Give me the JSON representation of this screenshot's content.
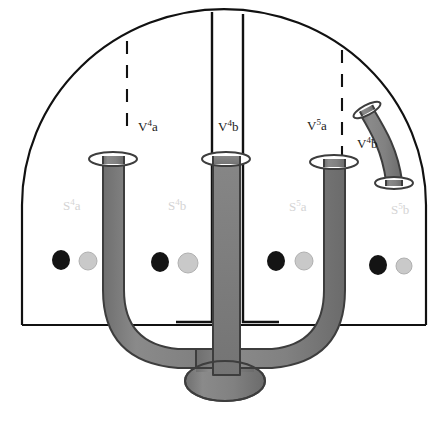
{
  "figure": {
    "background": "#ffffff",
    "outline_color": "#111111",
    "tube_fill": "#808080",
    "tube_stroke": "#3d3d3d",
    "dot_dark_color": "#141414",
    "dot_light_color": "#c9c9c9",
    "faint_label_color": "#d4d4d4"
  },
  "vessel_labels": [
    {
      "id": "v4a",
      "base": "V",
      "sup": "4",
      "tail": "a",
      "x": 138,
      "y": 131
    },
    {
      "id": "v4b",
      "base": "V",
      "sup": "4",
      "tail": "b",
      "x": 218,
      "y": 131
    },
    {
      "id": "v5a",
      "base": "V",
      "sup": "5",
      "tail": "a",
      "x": 307,
      "y": 130
    },
    {
      "id": "v4b_right",
      "base": "V",
      "sup": "4",
      "tail": "b",
      "x": 357,
      "y": 148
    }
  ],
  "chamber_labels": [
    {
      "id": "s4a",
      "base": "S",
      "sup": "4",
      "tail": "a",
      "x": 63,
      "y": 210
    },
    {
      "id": "s4b",
      "base": "S",
      "sup": "4",
      "tail": "b",
      "x": 168,
      "y": 210
    },
    {
      "id": "s5a",
      "base": "S",
      "sup": "5",
      "tail": "a",
      "x": 289,
      "y": 211
    },
    {
      "id": "s5b",
      "base": "S",
      "sup": "5",
      "tail": "b",
      "x": 391,
      "y": 214
    }
  ],
  "dots": [
    {
      "id": "dot-dark-1",
      "cx": 61,
      "cy": 260,
      "rx": 9,
      "ry": 10,
      "tone": "dark"
    },
    {
      "id": "dot-light-1",
      "cx": 88,
      "cy": 261,
      "rx": 9,
      "ry": 9,
      "tone": "light"
    },
    {
      "id": "dot-dark-2",
      "cx": 160,
      "cy": 262,
      "rx": 9,
      "ry": 10,
      "tone": "dark"
    },
    {
      "id": "dot-light-2",
      "cx": 188,
      "cy": 263,
      "rx": 10,
      "ry": 10,
      "tone": "light"
    },
    {
      "id": "dot-dark-3",
      "cx": 276,
      "cy": 261,
      "rx": 9,
      "ry": 10,
      "tone": "dark"
    },
    {
      "id": "dot-light-3",
      "cx": 304,
      "cy": 261,
      "rx": 9,
      "ry": 9,
      "tone": "light"
    },
    {
      "id": "dot-dark-4",
      "cx": 378,
      "cy": 265,
      "rx": 9,
      "ry": 10,
      "tone": "dark"
    },
    {
      "id": "dot-light-4",
      "cx": 404,
      "cy": 266,
      "rx": 8,
      "ry": 8,
      "tone": "light"
    }
  ],
  "tubes": {
    "left_tube_id": "tube-v4a",
    "center_tube_id": "tube-v4b",
    "right_tube_id": "tube-v5a",
    "detached_tube_id": "tube-v4b-detached",
    "base_bulb_id": "tube-base-bulb"
  },
  "dividers": {
    "dashed_left_id": "divider-dashed-left",
    "dashed_right_id": "divider-dashed-right",
    "solid_center_left_id": "divider-solid-center-left",
    "solid_center_right_id": "divider-solid-center-right"
  }
}
